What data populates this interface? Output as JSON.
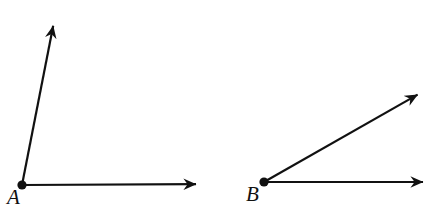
{
  "figure": {
    "type": "geometry-diagram",
    "background_color": "#ffffff",
    "stroke_color": "#111111",
    "stroke_width": 2,
    "width": 432,
    "height": 213,
    "top_text_sliver": "",
    "angles": [
      {
        "id": "angle-A",
        "vertex_label": "A",
        "vertex_point": {
          "x": 22,
          "y": 185
        },
        "vertex_dot_radius": 4.2,
        "label_position": {
          "x": 7,
          "y": 187
        },
        "rays": [
          {
            "id": "ray-A-horizontal",
            "name": "horizontal-ray",
            "from": {
              "x": 22,
              "y": 185
            },
            "to": {
              "x": 200,
              "y": 184
            },
            "arrowhead": "barbed",
            "direction_degrees": 0
          },
          {
            "id": "ray-A-upward",
            "name": "upward-ray",
            "from": {
              "x": 22,
              "y": 185
            },
            "to": {
              "x": 55,
              "y": 17
            },
            "arrowhead": "barbed",
            "direction_degrees": 79
          }
        ],
        "interior_angle_degrees": 79
      },
      {
        "id": "angle-B",
        "vertex_label": "B",
        "vertex_point": {
          "x": 264,
          "y": 182
        },
        "vertex_dot_radius": 4.2,
        "label_position": {
          "x": 246,
          "y": 184
        },
        "rays": [
          {
            "id": "ray-B-horizontal",
            "name": "horizontal-ray",
            "from": {
              "x": 264,
              "y": 182
            },
            "to": {
              "x": 427,
              "y": 182
            },
            "arrowhead": "barbed",
            "direction_degrees": 0
          },
          {
            "id": "ray-B-diagonal",
            "name": "diagonal-ray",
            "from": {
              "x": 264,
              "y": 182
            },
            "to": {
              "x": 428,
              "y": 88
            },
            "arrowhead": "barbed",
            "direction_degrees": 30
          }
        ],
        "interior_angle_degrees": 30
      }
    ]
  }
}
